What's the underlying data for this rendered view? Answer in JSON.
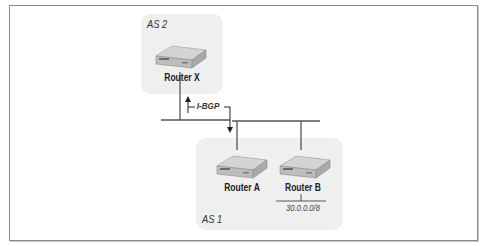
{
  "diagram": {
    "autonomous_systems": [
      {
        "id": "as2",
        "label": "AS 2"
      },
      {
        "id": "as1",
        "label": "AS 1"
      }
    ],
    "routers": [
      {
        "id": "router-x",
        "label": "Router X",
        "as": "AS 2"
      },
      {
        "id": "router-a",
        "label": "Router A",
        "as": "AS 1"
      },
      {
        "id": "router-b",
        "label": "Router B",
        "as": "AS 1"
      }
    ],
    "network": {
      "label": "30.0.0.0/8",
      "attached_to": "Router B"
    },
    "session": {
      "label": "I-BGP",
      "from": "Router X",
      "to": "Router A"
    },
    "colors": {
      "as_fill": "#efefef",
      "line": "#555555",
      "frame": "#8a8a8a"
    }
  }
}
